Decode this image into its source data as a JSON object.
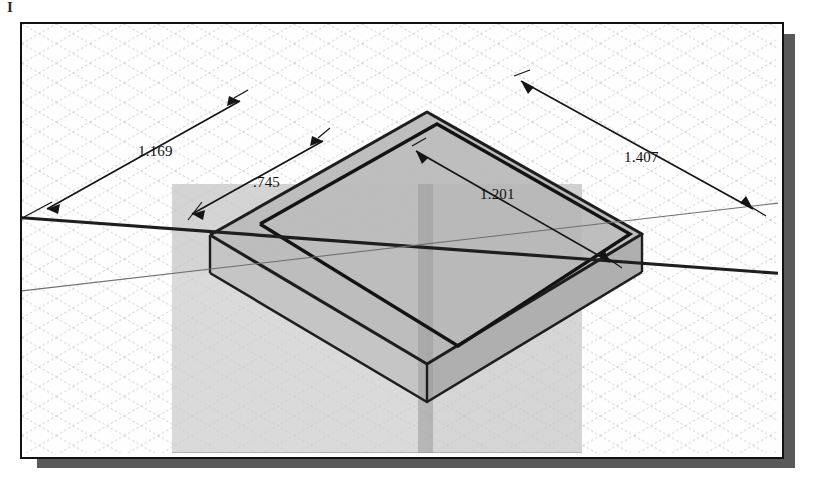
{
  "window": {
    "corner_mark": "I",
    "background_color": "#ffffff",
    "frame_border_color": "#111111",
    "frame_fill_color": "#fefefe",
    "shadow_color": "#595959"
  },
  "view": {
    "type": "isometric-cad-3d-view",
    "grid": {
      "visible": true,
      "style": "dotted-isometric-diamond",
      "color": "#c9c9c9",
      "spacing_px": 33
    },
    "colors": {
      "workplane_fill": "#d8d8d8",
      "workplane_overlap_fill": "#c2c2c2",
      "part_top_face": "#b5b5b5",
      "part_front_face": "#c8c8c8",
      "part_side_face": "#a8a8a8",
      "sketch_line": "#1a1a1a",
      "axis_line": "#1a1a1a",
      "dimension_line": "#1a1a1a",
      "dimension_text": "#101010"
    }
  },
  "dimensions": [
    {
      "id": "dim-1169",
      "label": "1.169",
      "value": 1.169,
      "position": "upper-left",
      "text_x": 136,
      "text_y": 153,
      "line": {
        "x1": 45,
        "y1": 206,
        "x2": 238,
        "y2": 98
      },
      "arrows": "both"
    },
    {
      "id": "dim-745",
      "label": ".745",
      "value": 0.745,
      "position": "upper-middle-left",
      "text_x": 251,
      "text_y": 184,
      "line": {
        "x1": 190,
        "y1": 211,
        "x2": 320,
        "y2": 138
      },
      "arrows": "both"
    },
    {
      "id": "dim-1201",
      "label": "1.201",
      "value": 1.201,
      "position": "middle-right",
      "text_x": 478,
      "text_y": 196,
      "line": {
        "x1": 414,
        "y1": 148,
        "x2": 608,
        "y2": 259
      },
      "arrows": "both"
    },
    {
      "id": "dim-1407",
      "label": "1.407",
      "value": 1.407,
      "position": "upper-right",
      "text_x": 622,
      "text_y": 159,
      "line": {
        "x1": 519,
        "y1": 78,
        "x2": 751,
        "y2": 206
      },
      "arrows": "both"
    }
  ],
  "geometry": {
    "workplane": {
      "name": "translucent-construction-plane",
      "points": "22,212 340,30 760,165 430,370"
    },
    "part": {
      "name": "extruded-plate",
      "top_face": "188,211 405,88 620,210 405,340",
      "front_left_face": "188,211 405,340 405,378 188,250",
      "front_right_face": "405,340 620,210 620,248 405,378"
    },
    "sketch_profile": {
      "name": "rectangle-sketch",
      "points": "238,200 415,100 608,210 436,322"
    },
    "axis_vertical": {
      "x1": 405,
      "y1": 160,
      "x2": 405,
      "y2": 427
    },
    "axis_diagonal": {
      "x1": 22,
      "y1": 198,
      "x2": 756,
      "y2": 258
    }
  }
}
